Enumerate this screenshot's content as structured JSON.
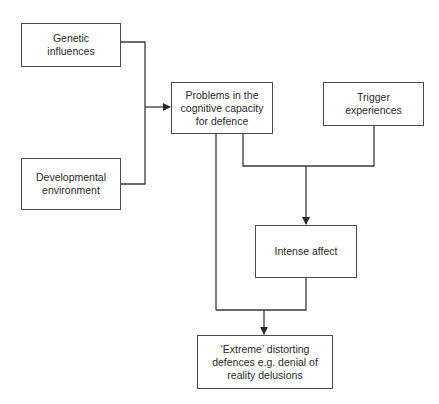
{
  "diagram": {
    "type": "flowchart",
    "nodes": {
      "genetic": {
        "label": "Genetic influences",
        "line1": "Genetic",
        "line2": "influences"
      },
      "developmental": {
        "label": "Developmental environment",
        "line1": "Developmental",
        "line2": "environment"
      },
      "problems": {
        "label": "Problems in the cognitive capacity for defence",
        "line1": "Problems in the",
        "line2": "cognitive capacity",
        "line3": "for defence"
      },
      "trigger": {
        "label": "Trigger experiences",
        "line1": "Trigger",
        "line2": "experiences"
      },
      "intense": {
        "label": "Intense affect",
        "line1": "Intense affect"
      },
      "extreme": {
        "label": "'Extreme' distorting defences e.g. denial of reality delusions",
        "line1": "‘Extreme’ distorting",
        "line2": "defences e.g. denial of",
        "line3": "reality delusions"
      }
    },
    "edges": [
      {
        "from": [
          "genetic",
          "developmental"
        ],
        "to": "problems"
      },
      {
        "from": [
          "problems",
          "trigger"
        ],
        "to": "intense"
      },
      {
        "from": [
          "problems",
          "intense"
        ],
        "to": "extreme"
      }
    ],
    "colors": {
      "line": "#3a3a3a",
      "border": "#4a4a4a",
      "background": "#ffffff",
      "text": "#2a2a2a"
    }
  }
}
